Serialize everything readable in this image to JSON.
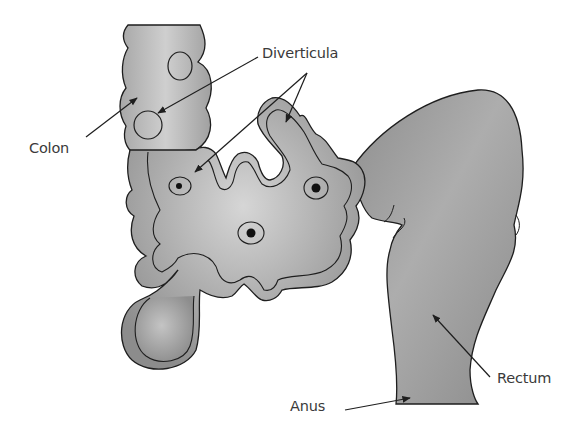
{
  "diagram": {
    "labels": {
      "diverticula": "Diverticula",
      "colon": "Colon",
      "anus": "Anus",
      "rectum": "Rectum"
    },
    "colors": {
      "tissue_light": "#d0d0d0",
      "tissue_mid": "#a8a8a8",
      "tissue_dark": "#8a8a8a",
      "outline": "#1e1e1e",
      "text": "#3a3a3a",
      "background": "#ffffff"
    },
    "parts": [
      {
        "name": "colon",
        "arrow_to": "colon segment"
      },
      {
        "name": "diverticula",
        "arrow_count": 3
      },
      {
        "name": "rectum"
      },
      {
        "name": "anus"
      }
    ]
  }
}
